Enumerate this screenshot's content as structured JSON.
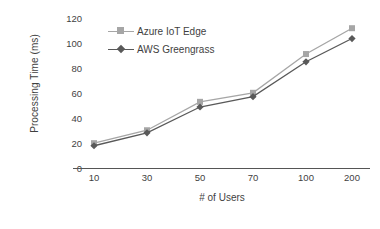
{
  "chart_data": {
    "type": "line",
    "title": "",
    "xlabel": "# of Users",
    "ylabel": "Processing Time (ms)",
    "categories": [
      "10",
      "30",
      "50",
      "70",
      "100",
      "200"
    ],
    "series": [
      {
        "name": "Azure IoT Edge",
        "color": "#a6a6a6",
        "marker": "square",
        "values": [
          20,
          30,
          52,
          59,
          89,
          109
        ]
      },
      {
        "name": "AWS Greengrass",
        "color": "#595959",
        "marker": "diamond",
        "values": [
          18,
          28,
          48,
          56,
          83,
          101
        ]
      }
    ],
    "ylim": [
      0,
      120
    ],
    "yticks": [
      "0",
      "20",
      "40",
      "60",
      "80",
      "100",
      "120"
    ],
    "grid": false,
    "legend_position": "top-left-inside"
  },
  "axes": {
    "y_title": "Processing Time (ms)",
    "x_title": "# of Users",
    "y_ticks": [
      "120",
      "100",
      "80",
      "60",
      "40",
      "20",
      "0"
    ],
    "x_ticks": [
      "10",
      "30",
      "50",
      "70",
      "100",
      "200"
    ]
  },
  "legend": {
    "items": [
      {
        "label": "Azure IoT Edge"
      },
      {
        "label": "AWS Greengrass"
      }
    ]
  },
  "colors": {
    "series_azure": "#a6a6a6",
    "series_aws": "#595959",
    "axis": "#555555",
    "text": "#3f3f3f"
  }
}
